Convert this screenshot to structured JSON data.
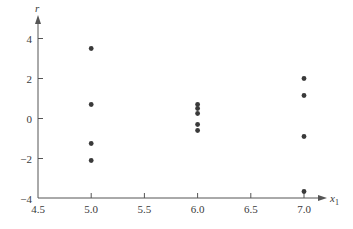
{
  "chart_data": {
    "type": "scatter",
    "title": "",
    "xlabel": "x1",
    "xlabel_main": "x",
    "xlabel_sub": "1",
    "ylabel": "r",
    "xlim": [
      4.5,
      7.0
    ],
    "ylim": [
      -4,
      4
    ],
    "xticks": [
      4.5,
      5.0,
      5.5,
      6.0,
      6.5,
      7.0
    ],
    "xtick_labels": [
      "4.5",
      "5.0",
      "5.5",
      "6.0",
      "6.5",
      "7.0"
    ],
    "yticks": [
      -4,
      -2,
      0,
      2,
      4
    ],
    "ytick_labels": [
      "−4",
      "−2",
      "0",
      "2",
      "4"
    ],
    "grid": false,
    "legend": null,
    "point_color": "#3a3a3a",
    "axis_color": "#555555",
    "series": [
      {
        "name": "residuals",
        "points": [
          {
            "x": 5.0,
            "y": 3.5
          },
          {
            "x": 5.0,
            "y": 0.7
          },
          {
            "x": 5.0,
            "y": -1.25
          },
          {
            "x": 5.0,
            "y": -2.1
          },
          {
            "x": 6.0,
            "y": 0.7
          },
          {
            "x": 6.0,
            "y": 0.5
          },
          {
            "x": 6.0,
            "y": 0.25
          },
          {
            "x": 6.0,
            "y": -0.3
          },
          {
            "x": 6.0,
            "y": -0.6
          },
          {
            "x": 7.0,
            "y": 2.0
          },
          {
            "x": 7.0,
            "y": 1.15
          },
          {
            "x": 7.0,
            "y": -0.9
          },
          {
            "x": 7.0,
            "y": -3.65
          }
        ]
      }
    ]
  }
}
